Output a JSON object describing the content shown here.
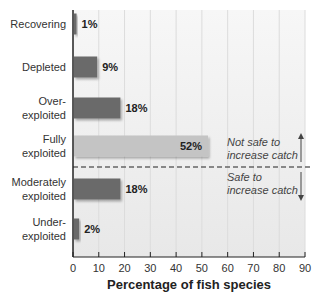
{
  "chart_data": {
    "type": "bar",
    "orientation": "horizontal",
    "title": "",
    "xlabel": "Percentage of fish species",
    "ylabel": "",
    "xlim": [
      0,
      90
    ],
    "xticks": [
      0,
      10,
      20,
      30,
      40,
      50,
      60,
      70,
      80,
      90
    ],
    "grid": true,
    "categories": [
      [
        "Recovering"
      ],
      [
        "Depleted"
      ],
      [
        "Over-",
        "exploited"
      ],
      [
        "Fully",
        "exploited"
      ],
      [
        "Moderately",
        "exploited"
      ],
      [
        "Under-",
        "exploited"
      ]
    ],
    "category_names": [
      "Recovering",
      "Depleted",
      "Over-exploited",
      "Fully exploited",
      "Moderately exploited",
      "Under-exploited"
    ],
    "values": [
      1,
      9,
      18,
      52,
      18,
      2
    ],
    "value_labels": [
      "1%",
      "9%",
      "18%",
      "52%",
      "18%",
      "2%"
    ],
    "bar_colors": [
      "#6a6a6a",
      "#6a6a6a",
      "#6a6a6a",
      "#c4c4c4",
      "#6a6a6a",
      "#6a6a6a"
    ],
    "annotations": {
      "divider": "dashed line between Fully exploited and Moderately exploited",
      "upper": [
        "Not safe to",
        "increase catch"
      ],
      "lower": [
        "Safe to",
        "increase catch"
      ]
    }
  }
}
